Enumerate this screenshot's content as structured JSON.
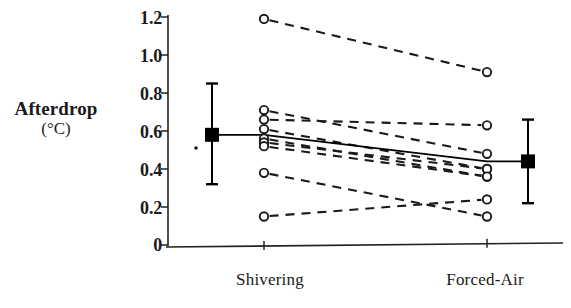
{
  "chart_data": {
    "type": "line",
    "title": "",
    "subtitle": "",
    "xlabel": "",
    "ylabel": "Afterdrop (°C)",
    "ylabel_line1": "Afterdrop",
    "ylabel_line2": "(°C)",
    "categories": [
      "Shivering",
      "Forced-Air"
    ],
    "x": [
      1,
      2
    ],
    "ylim": [
      0,
      1.2
    ],
    "xlim": [
      0.45,
      2.55
    ],
    "yticks": [
      0,
      0.2,
      0.4,
      0.6,
      0.8,
      1.0,
      1.2
    ],
    "ytick_labels": [
      "0",
      "0.2",
      "0.4",
      "0.6",
      "0.8",
      "1.0",
      "1.2"
    ],
    "xticks": [
      1,
      2
    ],
    "xtick_labels": [
      "Shivering",
      "Forced-Air"
    ],
    "grid": false,
    "legend": false,
    "legend_position": "none",
    "series": [
      {
        "name": "subject-1",
        "style": "dashed",
        "marker": "open-circle",
        "values": [
          1.19,
          0.91
        ]
      },
      {
        "name": "subject-2",
        "style": "dashed",
        "marker": "open-circle",
        "values": [
          0.71,
          0.48
        ]
      },
      {
        "name": "subject-3",
        "style": "dashed",
        "marker": "open-circle",
        "values": [
          0.66,
          0.63
        ]
      },
      {
        "name": "subject-4",
        "style": "dashed",
        "marker": "open-circle",
        "values": [
          0.61,
          0.4
        ]
      },
      {
        "name": "subject-5",
        "style": "dashed",
        "marker": "open-circle",
        "values": [
          0.56,
          0.36
        ]
      },
      {
        "name": "subject-6",
        "style": "dashed",
        "marker": "open-circle",
        "values": [
          0.54,
          0.4
        ]
      },
      {
        "name": "subject-7",
        "style": "dashed",
        "marker": "open-circle",
        "values": [
          0.52,
          0.36
        ]
      },
      {
        "name": "subject-8",
        "style": "dashed",
        "marker": "open-circle",
        "values": [
          0.38,
          0.15
        ]
      },
      {
        "name": "subject-9",
        "style": "dashed",
        "marker": "open-circle",
        "values": [
          0.15,
          0.24
        ]
      }
    ],
    "mean_series": {
      "name": "mean",
      "style": "solid",
      "marker": "filled-square",
      "values": [
        0.58,
        0.44
      ],
      "errorbars": [
        {
          "category": "Shivering",
          "mean": 0.58,
          "lower": 0.32,
          "upper": 0.85
        },
        {
          "category": "Forced-Air",
          "mean": 0.44,
          "lower": 0.22,
          "upper": 0.66
        }
      ]
    },
    "colors": {
      "axis": "#222222",
      "data_line": "#1a1a1a",
      "mean_line": "#000000",
      "marker_fill": "#ffffff",
      "marker_stroke": "#1a1a1a"
    }
  }
}
